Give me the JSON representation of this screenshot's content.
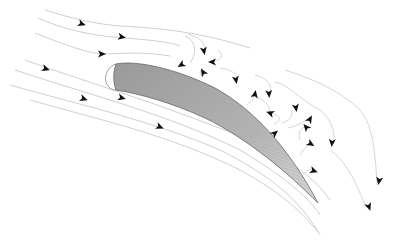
{
  "diagram": {
    "background": "#ffffff",
    "airfoil": {
      "fill": "#a9a9a9",
      "stroke": "#666666",
      "leading_edge_outline": "#888888",
      "trailing_edge": [
        318,
        203
      ]
    },
    "streamline_color": "#cfcfcf",
    "arrow_color": "#111111",
    "upper_streamlines": [
      {
        "d": "M45,10 C70,18 95,24 120,26 C160,28 200,32 250,48",
        "arrow": [
          82,
          24,
          20
        ]
      },
      {
        "d": "M38,18 C60,28 90,36 125,38 C150,40 170,42 180,46",
        "arrow": [
          122,
          37,
          10
        ]
      },
      {
        "d": "M35,33 C65,45 90,54 105,54 C130,53 145,52 170,56",
        "arrow": [
          102,
          54,
          0
        ]
      },
      {
        "d": "M185,36 C195,40 198,52 190,63",
        "arrow": [
          181,
          65,
          150
        ]
      }
    ],
    "lower_streamlines": [
      {
        "d": "M25,60 C80,80 150,100 250,140 C300,165 320,185 330,200",
        "arrow": [
          46,
          69,
          20
        ]
      },
      {
        "d": "M15,70 C90,95 170,115 240,150 C290,180 310,200 320,215",
        "arrow": [
          84,
          99,
          20
        ]
      },
      {
        "d": "M10,85 C80,105 150,120 220,150 C270,175 300,200 320,235",
        "arrow": [
          122,
          98,
          15
        ]
      },
      {
        "d": "M30,100 C100,120 170,135 240,170 C280,192 300,210 318,232",
        "arrow": [
          160,
          127,
          22
        ]
      }
    ],
    "separated_eddies": [
      {
        "d": "M188,34 C200,38 205,42 205,50",
        "arrow": [
          204,
          51,
          80
        ]
      },
      {
        "d": "M218,50 C224,55 222,60 212,62",
        "arrow": [
          212,
          62,
          180
        ]
      },
      {
        "d": "M205,75 C200,78 198,72 203,68",
        "arrow": [
          203,
          72,
          240
        ]
      },
      {
        "d": "M220,68 C232,70 238,74 237,80",
        "arrow": [
          236,
          80,
          80
        ]
      },
      {
        "d": "M255,75 C268,78 272,86 270,92",
        "arrow": [
          269,
          94,
          85
        ]
      },
      {
        "d": "M247,105 C252,100 255,98 254,93",
        "arrow": [
          255,
          94,
          280
        ]
      },
      {
        "d": "M275,82 C290,85 300,100 320,110 C330,118 335,130 334,142",
        "arrow": [
          332,
          143,
          95
        ]
      },
      {
        "d": "M285,70 C310,78 340,90 360,110 C370,122 375,140 377,185",
        "arrow": [
          379,
          181,
          100
        ]
      },
      {
        "d": "M270,113 C280,115 283,120 274,124",
        "arrow": [
          270,
          113,
          200
        ]
      },
      {
        "d": "M282,123 C290,120 292,118 292,110",
        "arrow": [
          296,
          108,
          80
        ]
      },
      {
        "d": "M288,128 C300,125 305,120 309,119",
        "arrow": [
          310,
          119,
          300
        ]
      },
      {
        "d": "M300,140 C298,132 300,128 305,127",
        "arrow": [
          306,
          127,
          230
        ]
      },
      {
        "d": "M300,155 C304,148 308,145 311,143",
        "arrow": [
          311,
          144,
          30
        ]
      },
      {
        "d": "M303,175 C306,170 311,168 314,170",
        "arrow": [
          314,
          171,
          20
        ]
      },
      {
        "d": "M330,150 C345,160 355,180 365,205",
        "arrow": [
          369,
          207,
          70
        ]
      },
      {
        "d": "M250,95 C262,98 270,104 270,112",
        "arrow": [
          275,
          133,
          320
        ]
      }
    ]
  }
}
